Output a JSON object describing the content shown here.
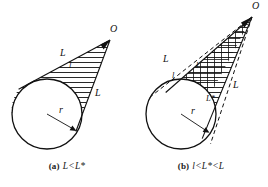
{
  "figure": {
    "background_color": "#ffffff",
    "stroke_color": "#111111",
    "panel_count": 2
  },
  "panels": [
    {
      "id": "a",
      "caption_tag": "(a)",
      "caption_expr": "L<L*",
      "caption_full": "(a)  L<L*",
      "circle": {
        "center_x": 47,
        "center_y": 114,
        "radius": 35,
        "radius_label": "r"
      },
      "apex": {
        "x": 110,
        "y": 40,
        "label": "O"
      },
      "labels": [
        {
          "name": "apex-label-O",
          "text": "O",
          "x": 112,
          "y": 30
        },
        {
          "name": "upper-tangent-label-L",
          "text": "L",
          "x": 62,
          "y": 55
        },
        {
          "name": "lower-tangent-label-L",
          "text": "L",
          "x": 96,
          "y": 95
        },
        {
          "name": "chord-label-l",
          "text": "l",
          "x": 69,
          "y": 66
        },
        {
          "name": "radius-label-r",
          "text": "r",
          "x": 60,
          "y": 111
        }
      ],
      "hatch": {
        "style": "horizontal",
        "spacing": 5
      },
      "tangent_style": "solid"
    },
    {
      "id": "b",
      "caption_tag": "(b)",
      "caption_expr": "l<L*<L",
      "caption_full": "(b)  l<L*<L",
      "circle": {
        "center_x": 47,
        "center_y": 114,
        "radius": 35,
        "radius_label": "r"
      },
      "apex": {
        "x": 118,
        "y": 17,
        "label": "O"
      },
      "labels": [
        {
          "name": "apex-label-O",
          "text": "O",
          "x": 120,
          "y": 7
        },
        {
          "name": "upper-tangent-label-L",
          "text": "L",
          "x": 30,
          "y": 60
        },
        {
          "name": "lower-tangent-label-L",
          "text": "L",
          "x": 100,
          "y": 87
        },
        {
          "name": "chord-label-l",
          "text": "l",
          "x": 39,
          "y": 76
        },
        {
          "name": "inner-label-l",
          "text": "l",
          "x": 62,
          "y": 66
        },
        {
          "name": "critical-label-L-star",
          "text": "L*",
          "x": 73,
          "y": 100
        },
        {
          "name": "radius-label-r",
          "text": "r",
          "x": 58,
          "y": 112
        }
      ],
      "hatch": {
        "style": "cross",
        "spacing": 5
      },
      "tangent_style": "dashed"
    }
  ],
  "symbols": {
    "O": "O",
    "L": "L",
    "l": "l",
    "r": "r",
    "L_star": "L*"
  }
}
